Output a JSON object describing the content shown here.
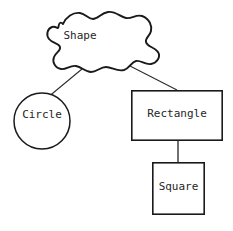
{
  "diagram": {
    "background_color": "#ffffff",
    "stroke_color": "#1a1a1a",
    "text_color": "#262626",
    "nodes": [
      {
        "id": "shape",
        "label": "Shape",
        "glyph": "cloud-blob-shape",
        "x": 45,
        "y": 12,
        "width": 115,
        "height": 60
      },
      {
        "id": "circle",
        "label": "Circle",
        "glyph": "circle-shape",
        "x": 14,
        "y": 93,
        "width": 56,
        "height": 56
      },
      {
        "id": "rectangle",
        "label": "Rectangle",
        "glyph": "rectangle-shape",
        "x": 131,
        "y": 90,
        "width": 92,
        "height": 51
      },
      {
        "id": "square",
        "label": "Square",
        "glyph": "square-shape",
        "x": 152,
        "y": 162,
        "width": 53,
        "height": 53
      }
    ],
    "edges": [
      {
        "id": "shape-circle",
        "from": "shape",
        "to": "circle"
      },
      {
        "id": "shape-rectangle",
        "from": "shape",
        "to": "rectangle"
      },
      {
        "id": "rectangle-square",
        "from": "rectangle",
        "to": "square"
      }
    ]
  }
}
